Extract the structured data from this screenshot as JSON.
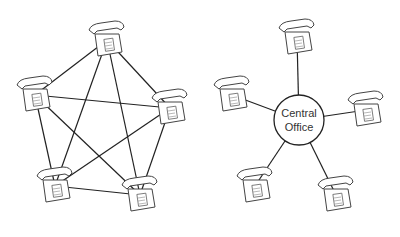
{
  "diagrams": [
    {
      "name": "mesh-network",
      "description": "Fully connected telephones (every phone wired to every other)",
      "phones": [
        {
          "id": "p1",
          "x": 107,
          "y": 40
        },
        {
          "id": "p2",
          "x": 35,
          "y": 95
        },
        {
          "id": "p3",
          "x": 170,
          "y": 108
        },
        {
          "id": "p4",
          "x": 55,
          "y": 186
        },
        {
          "id": "p5",
          "x": 140,
          "y": 195
        }
      ]
    },
    {
      "name": "star-network",
      "description": "Telephones connected through a central office",
      "hub": {
        "label_line1": "Central",
        "label_line2": "Office",
        "x": 299,
        "y": 120,
        "r": 25
      },
      "phones": [
        {
          "id": "s1",
          "x": 297,
          "y": 38
        },
        {
          "id": "s2",
          "x": 232,
          "y": 95
        },
        {
          "id": "s3",
          "x": 366,
          "y": 110
        },
        {
          "id": "s4",
          "x": 255,
          "y": 186
        },
        {
          "id": "s5",
          "x": 336,
          "y": 195
        }
      ]
    }
  ],
  "colors": {
    "line": "#222222",
    "fill": "#ffffff",
    "phone_stroke": "#444444"
  }
}
